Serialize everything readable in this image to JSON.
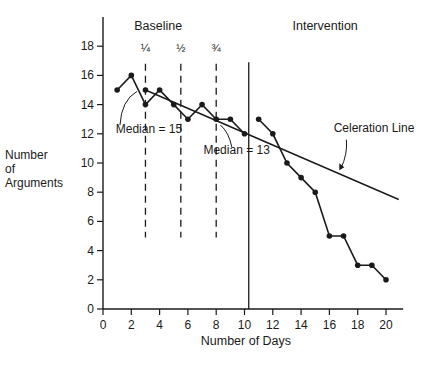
{
  "chart_data": {
    "type": "line",
    "title": "",
    "phases": [
      "Baseline",
      "Intervention"
    ],
    "xlabel": "Number of Days",
    "ylabel": "Number of Arguments",
    "ylabel_lines": [
      "Number",
      "of",
      "Arguments"
    ],
    "xlim": [
      0,
      21
    ],
    "ylim": [
      0,
      19
    ],
    "x_ticks": [
      0,
      2,
      4,
      6,
      8,
      10,
      12,
      14,
      16,
      18,
      20
    ],
    "y_ticks": [
      0,
      2,
      4,
      6,
      8,
      10,
      12,
      14,
      16,
      18
    ],
    "grid": false,
    "series": [
      {
        "name": "Baseline",
        "x": [
          1,
          2,
          3,
          4,
          5,
          6,
          7,
          8,
          9,
          10
        ],
        "values": [
          15,
          16,
          14,
          15,
          14,
          13,
          14,
          13,
          13,
          12
        ]
      },
      {
        "name": "Intervention",
        "x": [
          11,
          12,
          13,
          14,
          15,
          16,
          17,
          18,
          19,
          20
        ],
        "values": [
          13,
          12,
          10,
          9,
          8,
          5,
          5,
          3,
          3,
          2
        ]
      }
    ],
    "celeration_line": {
      "label": "Celeration Line",
      "start": [
        3,
        15
      ],
      "end": [
        20.9,
        7.5
      ]
    },
    "median_markers": [
      {
        "label": "Median = 15",
        "x": 3,
        "y": 15
      },
      {
        "label": "Median = 13",
        "x": 8,
        "y": 13
      }
    ],
    "quarter_lines": [
      {
        "label": "¼",
        "x": 3
      },
      {
        "label": "½",
        "x": 5.5
      },
      {
        "label": "¾",
        "x": 8
      }
    ],
    "phase_divider_x": 10.3
  }
}
